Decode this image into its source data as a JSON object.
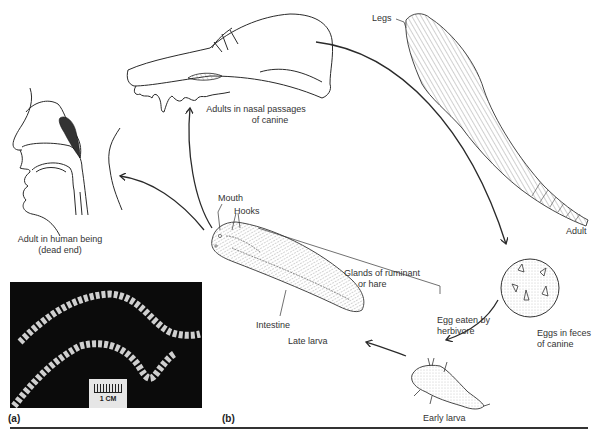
{
  "figure": {
    "panels": [
      {
        "id": "a",
        "label": "(a)"
      },
      {
        "id": "b",
        "label": "(b)"
      }
    ],
    "photo": {
      "description": "Photograph of two segmented tongue worm adults on black background",
      "scale_bar_label": "1 CM"
    },
    "life_cycle": {
      "stages": [
        {
          "id": "adult",
          "label": "Adult"
        },
        {
          "id": "eggs",
          "label_line1": "Eggs in feces",
          "label_line2": "of canine"
        },
        {
          "id": "early-larva",
          "label": "Early larva"
        },
        {
          "id": "late-larva",
          "label": "Late larva"
        },
        {
          "id": "canine-host",
          "label_line1": "Adults in nasal passages",
          "label_line2": "of canine"
        },
        {
          "id": "human-host",
          "label_line1": "Adult in human being",
          "label_line2": "(dead end)"
        }
      ],
      "transitions": [
        {
          "from": "canine-host",
          "to": "eggs"
        },
        {
          "from": "eggs",
          "to": "early-larva",
          "label_line1": "Egg eaten by",
          "label_line2": "herbivore"
        },
        {
          "from": "early-larva",
          "to": "late-larva"
        },
        {
          "from": "late-larva",
          "to": "canine-host"
        },
        {
          "from": "late-larva",
          "to": "human-host"
        }
      ],
      "annotations": {
        "legs": "Legs",
        "mouth": "Mouth",
        "hooks": "Hooks",
        "intestine": "Intestine",
        "glands_line1": "Glands of ruminant",
        "glands_line2": "or hare"
      }
    },
    "colors": {
      "line": "#2a2a2a",
      "photo_bg": "#0b0b0b",
      "worm": "#d8d8d8"
    }
  }
}
